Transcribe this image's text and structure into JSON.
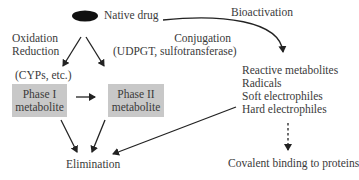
{
  "diagram": {
    "native_drug": "Native drug",
    "bioactivation": "Bioactivation",
    "phase1_reactions": [
      "Oxidation",
      "Reduction"
    ],
    "phase1_enzymes": "(CYPs, etc.)",
    "phase2_reactions": [
      "Conjugation",
      "(UDPGT, sulfotransferase)"
    ],
    "phase1_box": [
      "Phase I",
      "metabolite"
    ],
    "phase2_box": [
      "Phase II",
      "metabolite"
    ],
    "elimination": "Elimination",
    "reactive_species": [
      "Reactive metabolites",
      "Radicals",
      "Soft electrophiles",
      "Hard electrophiles"
    ],
    "covalent_binding": "Covalent binding to proteins",
    "colors": {
      "box_fill": "#c8c8c8",
      "ellipse": "#111111",
      "arrow": "#222222"
    }
  }
}
